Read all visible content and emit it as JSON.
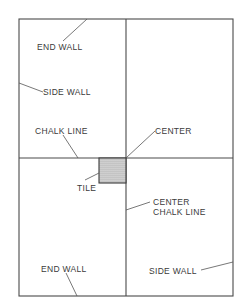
{
  "diagram": {
    "type": "floor-tile-layout",
    "labels": {
      "end_wall_top": "END WALL",
      "side_wall_left": "SIDE WALL",
      "chalk_line": "CHALK LINE",
      "center": "CENTER",
      "tile": "TILE",
      "center_chalk_line_1": "CENTER",
      "center_chalk_line_2": "CHALK LINE",
      "end_wall_bottom": "END WALL",
      "side_wall_right": "SIDE WALL"
    },
    "colors": {
      "line": "#4a4a4a",
      "text": "#3a3a3a",
      "tile_fill": "#cfcfcf",
      "background": "#ffffff"
    }
  }
}
